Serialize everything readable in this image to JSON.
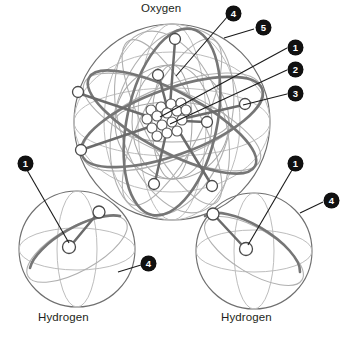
{
  "diagram": {
    "title_visible": false,
    "colors": {
      "outline_dark": "#4a4a4a",
      "outline_mid": "#8a8a8a",
      "outline_light": "#b5b5b5",
      "orbit_bold": "#6e6e6e",
      "badge_fill": "#111111",
      "badge_text": "#ffffff",
      "label_text": "#231f20",
      "electron_fill": "#ffffff",
      "background": "#ffffff"
    }
  },
  "labels": {
    "oxygen": "Oxygen",
    "hydrogen_left": "Hydrogen",
    "hydrogen_right": "Hydrogen"
  },
  "callouts": [
    {
      "id": "callout-4-top",
      "number": "4",
      "x": 226,
      "y": 6,
      "leader_to_x": 176,
      "leader_to_y": 76
    },
    {
      "id": "callout-5-top",
      "number": "5",
      "x": 256,
      "y": 20,
      "leader_to_x": 224,
      "leader_to_y": 38
    },
    {
      "id": "callout-1-right",
      "number": "1",
      "x": 288,
      "y": 40,
      "leader_to_x": 160,
      "leader_to_y": 117
    },
    {
      "id": "callout-2-right",
      "number": "2",
      "x": 288,
      "y": 62,
      "leader_to_x": 170,
      "leader_to_y": 124
    },
    {
      "id": "callout-3-right",
      "number": "3",
      "x": 288,
      "y": 86,
      "leader_to_x": 243,
      "leader_to_y": 105
    },
    {
      "id": "callout-1-left-h",
      "number": "1",
      "x": 18,
      "y": 156,
      "leader_to_x": 69,
      "leader_to_y": 247
    },
    {
      "id": "callout-4-left-h",
      "number": "4",
      "x": 141,
      "y": 256,
      "leader_to_x": 118,
      "leader_to_y": 270
    },
    {
      "id": "callout-1-right-h",
      "number": "1",
      "x": 288,
      "y": 156,
      "leader_to_x": 246,
      "leader_to_y": 249
    },
    {
      "id": "callout-4-right-h",
      "number": "4",
      "x": 324,
      "y": 193,
      "leader_to_x": 300,
      "leader_to_y": 211
    }
  ],
  "atoms": {
    "oxygen": {
      "name": "Oxygen",
      "label_x": 141,
      "label_y": 2,
      "sphere": {
        "cx": 172,
        "cy": 122,
        "r": 98
      },
      "inner_shell": {
        "cx": 172,
        "cy": 122,
        "r": 57
      },
      "nucleus": {
        "cx": 166,
        "cy": 120,
        "particle_count": 16,
        "particle_r": 5.0,
        "particles": [
          [
            151,
            110
          ],
          [
            161,
            107
          ],
          [
            171,
            104
          ],
          [
            181,
            103
          ],
          [
            147,
            119
          ],
          [
            157,
            116
          ],
          [
            167,
            113
          ],
          [
            177,
            111
          ],
          [
            186,
            110
          ],
          [
            152,
            128
          ],
          [
            162,
            125
          ],
          [
            172,
            122
          ],
          [
            182,
            120
          ],
          [
            157,
            136
          ],
          [
            167,
            133
          ],
          [
            177,
            131
          ]
        ]
      },
      "electrons": [
        {
          "cx": 175,
          "cy": 39,
          "r": 5.5
        },
        {
          "cx": 158,
          "cy": 75,
          "r": 5.5
        },
        {
          "cx": 78,
          "cy": 92,
          "r": 5.5
        },
        {
          "cx": 81,
          "cy": 150,
          "r": 5.5
        },
        {
          "cx": 245,
          "cy": 104,
          "r": 5.5
        },
        {
          "cx": 207,
          "cy": 122,
          "r": 5.5
        },
        {
          "cx": 154,
          "cy": 184,
          "r": 5.5
        },
        {
          "cx": 212,
          "cy": 186,
          "r": 5.5
        }
      ],
      "electron_count": 8
    },
    "hydrogen_left": {
      "name": "Hydrogen",
      "label_x": 38,
      "label_y": 311,
      "sphere": {
        "cx": 77,
        "cy": 249,
        "r": 58
      },
      "nucleus": {
        "cx": 69,
        "cy": 247,
        "r": 6.5
      },
      "electron": {
        "cx": 99,
        "cy": 212,
        "r": 6.0
      },
      "orbit": {
        "cx": 77,
        "cy": 249,
        "rx": 56,
        "ry": 22,
        "rotate": -29
      }
    },
    "hydrogen_right": {
      "name": "Hydrogen",
      "label_x": 221,
      "label_y": 311,
      "sphere": {
        "cx": 254,
        "cy": 251,
        "r": 58
      },
      "nucleus": {
        "cx": 246,
        "cy": 249,
        "r": 6.5
      },
      "electron": {
        "cx": 213,
        "cy": 214,
        "r": 6.0
      },
      "orbit": {
        "cx": 254,
        "cy": 251,
        "rx": 56,
        "ry": 22,
        "rotate": 31
      }
    }
  }
}
